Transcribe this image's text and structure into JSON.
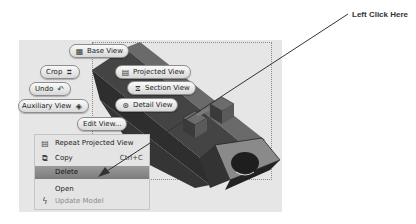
{
  "annotation": {
    "callout_text": "Left Click Here"
  },
  "marking_menu": {
    "items": [
      {
        "label": "Base View",
        "icon": "base-view-icon"
      },
      {
        "label": "Crop",
        "icon": "crop-icon"
      },
      {
        "label": "Projected View",
        "icon": "projected-view-icon"
      },
      {
        "label": "Undo",
        "icon": "undo-icon"
      },
      {
        "label": "Section View",
        "icon": "section-view-icon"
      },
      {
        "label": "Auxiliary View",
        "icon": "auxiliary-view-icon"
      },
      {
        "label": "Detail View",
        "icon": "detail-view-icon"
      },
      {
        "label": "Edit View...",
        "icon": ""
      }
    ]
  },
  "context_menu": {
    "items": [
      {
        "label": "Repeat Projected View",
        "icon": "projected-view-icon",
        "shortcut": "",
        "state": "normal"
      },
      {
        "label": "Copy",
        "icon": "copy-icon",
        "shortcut": "Ctrl+C",
        "state": "normal"
      },
      {
        "label": "Delete",
        "icon": "",
        "shortcut": "",
        "state": "highlighted"
      },
      {
        "label": "Open",
        "icon": "",
        "shortcut": "",
        "state": "normal"
      },
      {
        "label": "Update Model",
        "icon": "update-model-icon",
        "shortcut": "",
        "state": "disabled"
      }
    ]
  },
  "colors": {
    "canvas_bg": "#e6e6e6",
    "highlight": "#888888",
    "part_dark": "#3a3a3a",
    "part_mid": "#6e6e6e",
    "part_light": "#8c8c8c"
  }
}
